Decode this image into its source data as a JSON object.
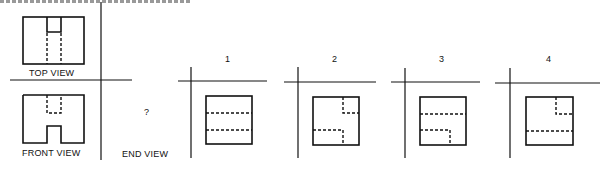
{
  "figure": {
    "header_cutoff": true,
    "given_views": {
      "top_view_label": "TOP VIEW",
      "front_view_label": "FRONT VIEW",
      "end_view_label": "END VIEW",
      "end_view_unknown": "?"
    },
    "options": [
      {
        "label": "1"
      },
      {
        "label": "2"
      },
      {
        "label": "3"
      },
      {
        "label": "4"
      }
    ],
    "colors": {
      "ink": "#111111",
      "paper": "#ffffff"
    }
  }
}
